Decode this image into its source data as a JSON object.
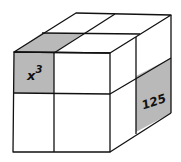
{
  "diagram": {
    "type": "cube-2x2x2",
    "colors": {
      "stroke": "#111111",
      "face": "#ffffff",
      "shaded": "#b9b9b9"
    },
    "labels": {
      "front_top_left": "x",
      "front_top_left_exponent": "3",
      "right_bottom_back": "125"
    }
  }
}
